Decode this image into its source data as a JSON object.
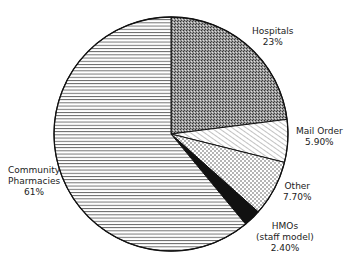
{
  "chart_data": {
    "type": "pie",
    "title": "",
    "categories": [
      "Hospitals",
      "Mail Order",
      "Other",
      "HMOs (staff model)",
      "Community Pharmacies"
    ],
    "values": [
      23,
      5.9,
      7.7,
      2.4,
      61
    ],
    "value_labels": [
      "23%",
      "5.90%",
      "7.70%",
      "2.40%",
      "61%"
    ],
    "start_angle_deg": 0,
    "direction": "clockwise",
    "fills": [
      "stipple",
      "diagonal-hatch",
      "dots",
      "solid-black",
      "horizontal-lines"
    ],
    "legend": "none (direct labels)"
  },
  "labels": {
    "hospitals": {
      "name": "Hospitals",
      "value": "23%"
    },
    "mail_order": {
      "name": "Mail Order",
      "value": "5.90%"
    },
    "other": {
      "name": "Other",
      "value": "7.70%"
    },
    "hmos": {
      "name": "HMOs",
      "name2": "(staff model)",
      "value": "2.40%"
    },
    "community": {
      "name": "Community",
      "name2": "Pharmacies",
      "value": "61%"
    }
  },
  "colors": {
    "ink": "#111111",
    "background": "#ffffff"
  }
}
